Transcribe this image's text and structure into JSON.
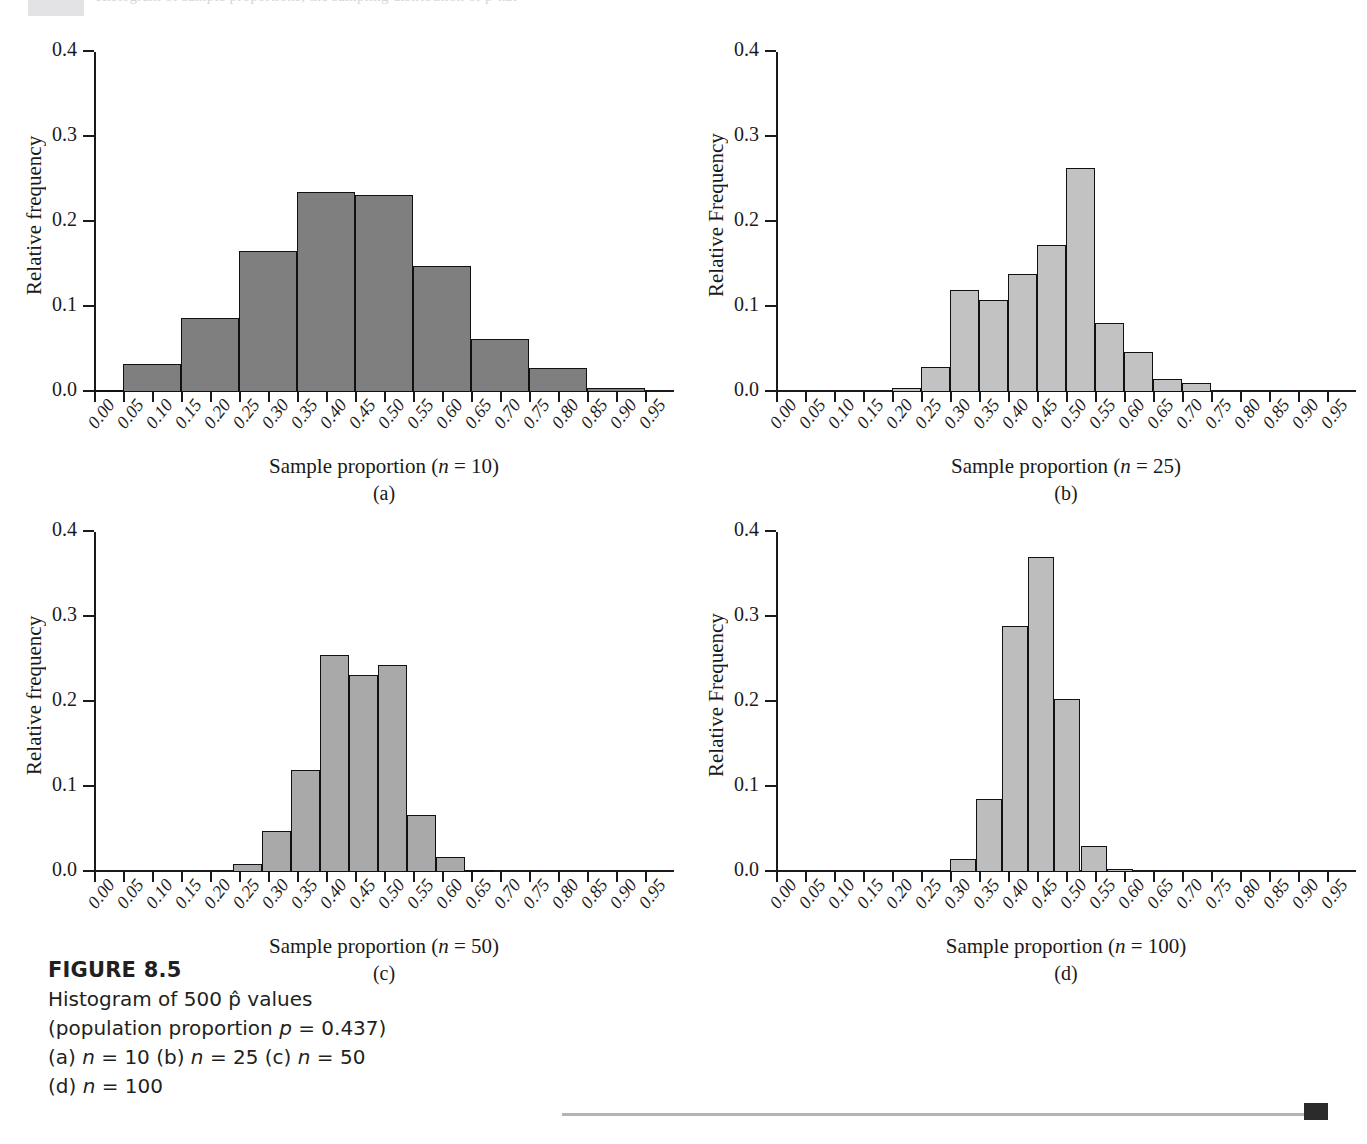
{
  "top_strip": {
    "faint_text": "Histogram of sample proportions; the sampling distribution of p-hat"
  },
  "caption": {
    "title": "FIGURE 8.5",
    "lines": [
      "Histogram of 500 p̂ values",
      "(population proportion p = 0.437)",
      "(a) n = 10 (b) n = 25 (c) n = 50",
      "(d) n = 100"
    ]
  },
  "colors": {
    "ink": "#1a1a1a",
    "fill_a": "#7f7f7f",
    "fill_b": "#c2c2c2",
    "fill_c": "#a9a9a9",
    "fill_d": "#bdbdbd",
    "rule": "#b4b4b7"
  },
  "x_tick_labels": [
    "0.00",
    "0.05",
    "0.10",
    "0.15",
    "0.20",
    "0.25",
    "0.30",
    "0.35",
    "0.40",
    "0.45",
    "0.50",
    "0.55",
    "0.60",
    "0.65",
    "0.70",
    "0.75",
    "0.80",
    "0.85",
    "0.90",
    "0.95"
  ],
  "y_tick_labels": [
    "0.0",
    "0.1",
    "0.2",
    "0.3",
    "0.4"
  ],
  "chart_data": [
    {
      "id": "a",
      "type": "bar",
      "title": "",
      "panel_letter": "(a)",
      "xlabel": "Sample proportion (n = 10)",
      "ylabel": "Relative frequency",
      "sample_size": 10,
      "bin_width": 0.05,
      "xlim": [
        0.0,
        1.0
      ],
      "ylim": [
        0.0,
        0.4
      ],
      "yticks": [
        0.0,
        0.1,
        0.2,
        0.3,
        0.4
      ],
      "grid": false,
      "legend": "none",
      "bin_starts": [
        0.0,
        0.05,
        0.1,
        0.15,
        0.2,
        0.25,
        0.3,
        0.35,
        0.4,
        0.45,
        0.5,
        0.55,
        0.6,
        0.65,
        0.7,
        0.75,
        0.8,
        0.85,
        0.9,
        0.95
      ],
      "values": [
        0.002,
        0.0,
        0.033,
        0.0,
        0.087,
        0.0,
        0.166,
        0.0,
        0.235,
        0.0,
        0.232,
        0.0,
        0.148,
        0.0,
        0.062,
        0.0,
        0.028,
        0.0,
        0.005,
        0.0
      ],
      "bars": [
        {
          "x0": 0.05,
          "x1": 0.15,
          "value": 0.033
        },
        {
          "x0": 0.15,
          "x1": 0.25,
          "value": 0.087
        },
        {
          "x0": 0.25,
          "x1": 0.35,
          "value": 0.166
        },
        {
          "x0": 0.35,
          "x1": 0.45,
          "value": 0.235
        },
        {
          "x0": 0.45,
          "x1": 0.55,
          "value": 0.232
        },
        {
          "x0": 0.55,
          "x1": 0.65,
          "value": 0.148
        },
        {
          "x0": 0.65,
          "x1": 0.75,
          "value": 0.062
        },
        {
          "x0": 0.75,
          "x1": 0.85,
          "value": 0.028
        },
        {
          "x0": 0.85,
          "x1": 0.95,
          "value": 0.005
        },
        {
          "x0": 0.0,
          "x1": 0.05,
          "value": 0.002
        }
      ]
    },
    {
      "id": "b",
      "type": "bar",
      "title": "",
      "panel_letter": "(b)",
      "xlabel": "Sample proportion (n = 25)",
      "ylabel": "Relative Frequency",
      "sample_size": 25,
      "bin_width": 0.05,
      "xlim": [
        0.0,
        1.0
      ],
      "ylim": [
        0.0,
        0.4
      ],
      "yticks": [
        0.0,
        0.1,
        0.2,
        0.3,
        0.4
      ],
      "grid": false,
      "legend": "none",
      "bars": [
        {
          "x0": 0.2,
          "x1": 0.25,
          "value": 0.005
        },
        {
          "x0": 0.25,
          "x1": 0.3,
          "value": 0.029
        },
        {
          "x0": 0.3,
          "x1": 0.35,
          "value": 0.12
        },
        {
          "x0": 0.35,
          "x1": 0.4,
          "value": 0.108
        },
        {
          "x0": 0.4,
          "x1": 0.45,
          "value": 0.139
        },
        {
          "x0": 0.45,
          "x1": 0.5,
          "value": 0.173
        },
        {
          "x0": 0.5,
          "x1": 0.55,
          "value": 0.264
        },
        {
          "x0": 0.55,
          "x1": 0.6,
          "value": 0.081
        },
        {
          "x0": 0.6,
          "x1": 0.65,
          "value": 0.047
        },
        {
          "x0": 0.65,
          "x1": 0.7,
          "value": 0.015
        },
        {
          "x0": 0.7,
          "x1": 0.75,
          "value": 0.011
        }
      ]
    },
    {
      "id": "c",
      "type": "bar",
      "title": "",
      "panel_letter": "(c)",
      "xlabel": "Sample proportion (n = 50)",
      "ylabel": "Relative frequency",
      "sample_size": 50,
      "bin_width": 0.05,
      "xlim": [
        0.0,
        1.0
      ],
      "ylim": [
        0.0,
        0.4
      ],
      "yticks": [
        0.0,
        0.1,
        0.2,
        0.3,
        0.4
      ],
      "grid": false,
      "legend": "none",
      "bars": [
        {
          "x0": 0.24,
          "x1": 0.29,
          "value": 0.01
        },
        {
          "x0": 0.29,
          "x1": 0.34,
          "value": 0.048
        },
        {
          "x0": 0.34,
          "x1": 0.39,
          "value": 0.12
        },
        {
          "x0": 0.39,
          "x1": 0.44,
          "value": 0.255
        },
        {
          "x0": 0.44,
          "x1": 0.49,
          "value": 0.232
        },
        {
          "x0": 0.49,
          "x1": 0.54,
          "value": 0.244
        },
        {
          "x0": 0.54,
          "x1": 0.59,
          "value": 0.067
        },
        {
          "x0": 0.59,
          "x1": 0.64,
          "value": 0.018
        },
        {
          "x0": 0.64,
          "x1": 0.69,
          "value": 0.002
        }
      ]
    },
    {
      "id": "d",
      "type": "bar",
      "title": "",
      "panel_letter": "(d)",
      "xlabel": "Sample proportion (n = 100)",
      "ylabel": "Relative Frequency",
      "sample_size": 100,
      "bin_width": 0.05,
      "xlim": [
        0.0,
        1.0
      ],
      "ylim": [
        0.0,
        0.4
      ],
      "yticks": [
        0.0,
        0.1,
        0.2,
        0.3,
        0.4
      ],
      "grid": false,
      "legend": "none",
      "bars": [
        {
          "x0": 0.3,
          "x1": 0.345,
          "value": 0.015
        },
        {
          "x0": 0.345,
          "x1": 0.39,
          "value": 0.086
        },
        {
          "x0": 0.39,
          "x1": 0.435,
          "value": 0.289
        },
        {
          "x0": 0.435,
          "x1": 0.48,
          "value": 0.371
        },
        {
          "x0": 0.48,
          "x1": 0.525,
          "value": 0.204
        },
        {
          "x0": 0.525,
          "x1": 0.57,
          "value": 0.031
        },
        {
          "x0": 0.57,
          "x1": 0.615,
          "value": 0.003
        }
      ]
    }
  ]
}
